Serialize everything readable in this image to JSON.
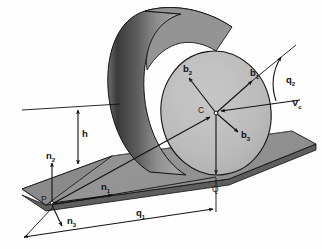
{
  "figure": {
    "domain_type": "diagram",
    "background_color": "#fefefe"
  },
  "colors": {
    "outline": "#111111",
    "disc_face": "#b9b9b9",
    "disc_face_highlight": "#c6c6c6",
    "cylinder_body_light": "#9a9a9a",
    "cylinder_body_mid": "#848484",
    "cylinder_body_dark": "#3a3a3a",
    "plane_top": "#8e8e8e",
    "plane_top_light": "#9b9b9b",
    "plane_edge": "#5a5a5a",
    "plane_side": "#6e6e6e",
    "label_text": "#111111"
  },
  "labels": {
    "body_frame": [
      {
        "id": "b1",
        "base": "b",
        "sub": "1",
        "x": 253,
        "y": 73,
        "desc": "body-fixed unit vector 1"
      },
      {
        "id": "b2",
        "base": "b",
        "sub": "2",
        "x": 186,
        "y": 70,
        "desc": "body-fixed unit vector 2"
      },
      {
        "id": "b3",
        "base": "b",
        "sub": "3",
        "x": 243,
        "y": 131,
        "desc": "body-fixed unit vector 3"
      }
    ],
    "inertial_frame": [
      {
        "id": "n1",
        "base": "n",
        "sub": "1",
        "x": 105,
        "y": 190,
        "desc": "inertial unit vector 1"
      },
      {
        "id": "n2",
        "base": "n",
        "sub": "2",
        "x": 51,
        "y": 157,
        "desc": "inertial unit vector 2"
      },
      {
        "id": "n3",
        "base": "n",
        "sub": "3",
        "x": 72,
        "y": 224,
        "desc": "inertial unit vector 3"
      }
    ],
    "points": [
      {
        "id": "C",
        "text": "C",
        "x": 196,
        "y": 114,
        "desc": "center of disc"
      },
      {
        "id": "P",
        "text": "P",
        "x": 43,
        "y": 202,
        "desc": "origin on plane"
      },
      {
        "id": "Q",
        "text": "Q",
        "x": 215,
        "y": 191,
        "desc": "contact point"
      }
    ],
    "dimensions": [
      {
        "id": "h",
        "base": "h",
        "sub": "",
        "x": 82,
        "y": 137,
        "desc": "height of disc center above plane"
      },
      {
        "id": "q1",
        "base": "q",
        "sub": "1",
        "x": 141,
        "y": 216,
        "desc": "translation coordinate along plane"
      },
      {
        "id": "q2",
        "base": "q",
        "sub": "2",
        "x": 290,
        "y": 79,
        "desc": "rotation coordinate of disc"
      }
    ],
    "velocity": [
      {
        "id": "Vc",
        "base": "V",
        "sub": "c",
        "x": 295,
        "y": 104,
        "desc": "velocity of center C"
      }
    ]
  },
  "geometry": {
    "disc_center": {
      "x": 216,
      "y": 113
    },
    "contact_point": {
      "x": 216,
      "y": 175
    },
    "origin_point": {
      "x": 52,
      "y": 203
    },
    "disc_radius_x": 55,
    "disc_radius_y": 62,
    "height_value_label": "h",
    "distance_value_label": "q1"
  }
}
